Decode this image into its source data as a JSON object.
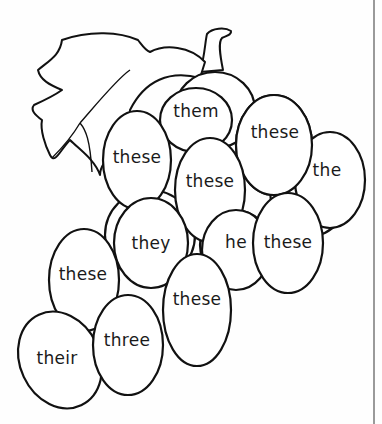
{
  "worksheet": {
    "title": "Grape bunch word coloring page",
    "words": [
      {
        "id": "them",
        "text": "them",
        "x": 196,
        "y": 111
      },
      {
        "id": "these-top-right",
        "text": "these",
        "x": 275,
        "y": 132
      },
      {
        "id": "these-left",
        "text": "these",
        "x": 137,
        "y": 157
      },
      {
        "id": "the",
        "text": "the",
        "x": 327,
        "y": 170
      },
      {
        "id": "these-center",
        "text": "these",
        "x": 210,
        "y": 181
      },
      {
        "id": "they",
        "text": "they",
        "x": 151,
        "y": 243
      },
      {
        "id": "he",
        "text": "he",
        "x": 236,
        "y": 242
      },
      {
        "id": "these-right",
        "text": "these",
        "x": 288,
        "y": 242
      },
      {
        "id": "these-mid-left",
        "text": "these",
        "x": 83,
        "y": 274
      },
      {
        "id": "these-bottom",
        "text": "these",
        "x": 197,
        "y": 299
      },
      {
        "id": "three",
        "text": "three",
        "x": 127,
        "y": 340
      },
      {
        "id": "their",
        "text": "their",
        "x": 57,
        "y": 358
      }
    ]
  },
  "colors": {
    "outline": "#111111",
    "paper": "#fefefe",
    "edge": "#9a9a9a"
  }
}
